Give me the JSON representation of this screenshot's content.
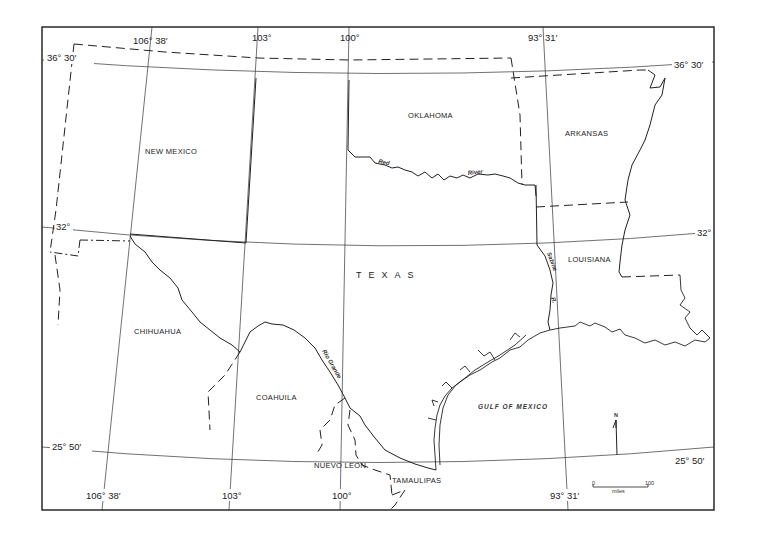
{
  "map": {
    "title": "",
    "regions": {
      "texas": "TEXAS",
      "new_mexico": "NEW MEXICO",
      "oklahoma": "OKLAHOMA",
      "arkansas": "ARKANSAS",
      "louisiana": "LOUISIANA",
      "chihuahua": "CHIHUAHUA",
      "coahuila": "COAHUILA",
      "nuevo_leon": "NUEVO LEON",
      "tamaulipas": "TAMAULIPAS",
      "gulf": "GULF OF MEXICO"
    },
    "rivers": {
      "red_1": "Red",
      "red_2": "River",
      "sabine_1": "Sabine",
      "sabine_2": "R.",
      "rio_grande": "Rio Grande"
    },
    "latitudes": {
      "top_left": "36° 30′",
      "top_right": "36° 30′",
      "mid_left": "32°",
      "mid_right": "32°",
      "bottom_left": "25° 50′",
      "bottom_right": "25° 50′"
    },
    "longitudes": {
      "top": [
        "106° 38′",
        "103°",
        "100°",
        "93° 31′"
      ],
      "bottom": [
        "106° 38′",
        "103°",
        "100°",
        "93° 31′"
      ]
    },
    "north_arrow": "N",
    "scale": {
      "start": "0",
      "end": "100",
      "unit": "miles"
    }
  }
}
